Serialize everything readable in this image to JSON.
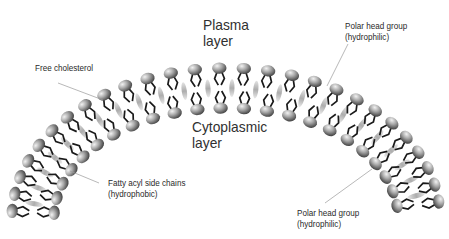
{
  "diagram": {
    "title_outer": [
      "Plasma",
      "layer"
    ],
    "title_inner": [
      "Cytoplasmic",
      "layer"
    ],
    "labels": {
      "free_cholesterol": "Free cholesterol",
      "polar_head_top": [
        "Polar head group",
        "(hydrophilic)"
      ],
      "fatty_acyl": [
        "Fatty acyl side chains",
        "(hydrophobic)"
      ],
      "polar_head_bottom": [
        "Polar head group",
        "(hydrophilic)"
      ]
    },
    "colors": {
      "background": "#ffffff",
      "head_light": "#e8e8e8",
      "head_dark": "#555555",
      "tail": "#1a1a1a",
      "cholesterol": "#bdbdbd",
      "leader_line": "#9a9a9a",
      "text": "#2a2a2a"
    },
    "geometry": {
      "center_x": 226,
      "center_y": 218,
      "outer_rx": 214,
      "outer_ry": 150,
      "inner_rx": 172,
      "inner_ry": 110,
      "outer_head_count": 27,
      "inner_head_count": 23
    }
  }
}
